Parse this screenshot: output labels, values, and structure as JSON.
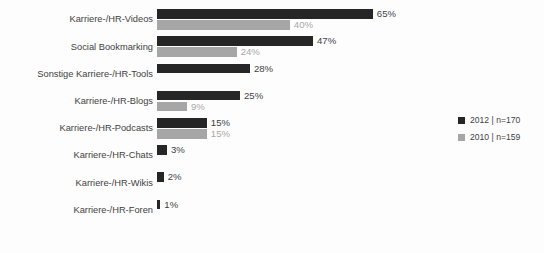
{
  "chart_data": {
    "type": "bar",
    "orientation": "horizontal",
    "title": "",
    "subtitle": "",
    "xlabel": "",
    "ylabel": "",
    "grid": false,
    "legend_position": "right",
    "xlim": [
      0,
      65
    ],
    "unit": "%",
    "categories": [
      "Karriere-/HR-Videos",
      "Social Bookmarking",
      "Sonstige Karriere-/HR-Tools",
      "Karriere-/HR-Blogs",
      "Karriere-/HR-Podcasts",
      "Karriere-/HR-Chats",
      "Karriere-/HR-Wikis",
      "Karriere-/HR-Foren"
    ],
    "series": [
      {
        "name": "2012 | n=170",
        "color": "#262626",
        "values": [
          65,
          47,
          28,
          25,
          15,
          3,
          2,
          1
        ],
        "labels": [
          "65%",
          "47%",
          "28%",
          "25%",
          "15%",
          "3%",
          "2%",
          "1%"
        ]
      },
      {
        "name": "2010 | n=159",
        "color": "#a6a6a6",
        "values": [
          40,
          24,
          null,
          9,
          15,
          null,
          null,
          null
        ],
        "labels": [
          "40%",
          "24%",
          null,
          "9%",
          "15%",
          null,
          null,
          null
        ]
      }
    ]
  },
  "legend": {
    "items": [
      {
        "label": "2012 | n=170",
        "color": "#262626"
      },
      {
        "label": "2010 | n=159",
        "color": "#a6a6a6"
      }
    ]
  }
}
